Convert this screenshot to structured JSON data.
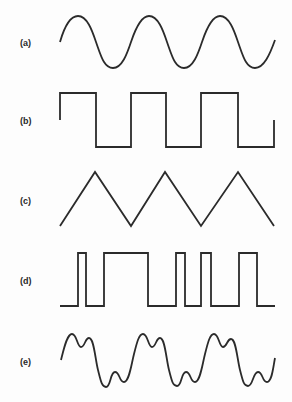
{
  "figure": {
    "stroke_color": "#2b2b2b",
    "background": "#fdfdfd",
    "waveforms": [
      {
        "id": "a",
        "label": "(a)",
        "kind": "sine",
        "cycles": 3
      },
      {
        "id": "b",
        "label": "(b)",
        "kind": "square",
        "cycles": 3
      },
      {
        "id": "c",
        "label": "(c)",
        "kind": "triangle",
        "cycles": 3
      },
      {
        "id": "d",
        "label": "(d)",
        "kind": "pulse-width-modulated",
        "pulses": 5
      },
      {
        "id": "e",
        "label": "(e)",
        "kind": "complex-harmonic",
        "cycles": 3
      }
    ]
  }
}
